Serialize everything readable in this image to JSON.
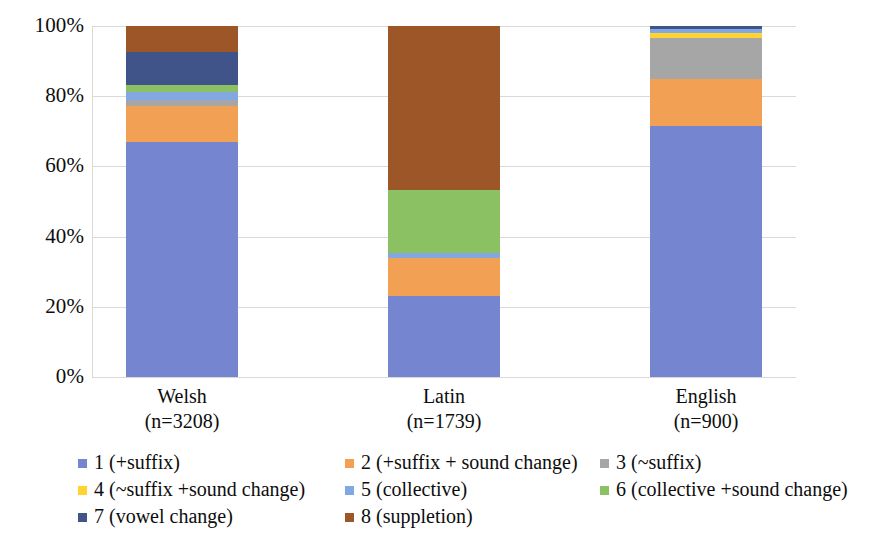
{
  "chart_data": {
    "type": "bar",
    "subtype": "stacked-percent",
    "title": "",
    "xlabel": "",
    "ylabel": "",
    "ylim": [
      0,
      100
    ],
    "ytick_labels": [
      "0%",
      "20%",
      "40%",
      "60%",
      "80%",
      "100%"
    ],
    "ytick_values": [
      0,
      20,
      40,
      60,
      80,
      100
    ],
    "grid": true,
    "legend_position": "bottom",
    "categories": [
      "Welsh",
      "Latin",
      "English"
    ],
    "category_sublabels": [
      "(n=3208)",
      "(n=1739)",
      "(n=900)"
    ],
    "category_counts": [
      3208,
      1739,
      900
    ],
    "series": [
      {
        "name": "1 (+suffix)",
        "color": "#7585d0",
        "values": [
          67.0,
          23.0,
          71.5
        ]
      },
      {
        "name": "2 (+suffix + sound change)",
        "color": "#f2a154",
        "values": [
          10.2,
          11.0,
          13.5
        ]
      },
      {
        "name": "3 (~suffix)",
        "color": "#a6a6a6",
        "values": [
          1.7,
          0.0,
          11.5
        ]
      },
      {
        "name": "4 (~suffix +sound change)",
        "color": "#ffd430",
        "values": [
          0.0,
          0.0,
          1.6
        ]
      },
      {
        "name": "5 (collective)",
        "color": "#81a8e0",
        "values": [
          2.3,
          1.2,
          1.0
        ]
      },
      {
        "name": "6 (collective +sound change)",
        "color": "#8cc163",
        "values": [
          2.0,
          18.0,
          0.0
        ]
      },
      {
        "name": "7 (vowel change)",
        "color": "#41548a",
        "values": [
          9.4,
          0.0,
          0.9
        ]
      },
      {
        "name": "8 (suppletion)",
        "color": "#9c5628",
        "values": [
          7.4,
          46.8,
          0.0
        ]
      }
    ]
  },
  "legend": {
    "items": [
      {
        "label": "1 (+suffix)"
      },
      {
        "label": "2 (+suffix + sound change)"
      },
      {
        "label": "3 (~suffix)"
      },
      {
        "label": "4 (~suffix +sound change)"
      },
      {
        "label": "5 (collective)"
      },
      {
        "label": "6 (collective +sound change)"
      },
      {
        "label": "7 (vowel change)"
      },
      {
        "label": "8 (suppletion)"
      }
    ]
  }
}
